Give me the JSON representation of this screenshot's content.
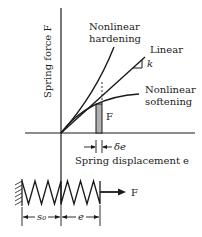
{
  "diagram": {
    "y_axis_label": "Spring force F",
    "x_axis_label": "Spring displacement e",
    "curves": [
      {
        "name": "hardening",
        "label_line1": "Nonlinear",
        "label_line2": "hardening"
      },
      {
        "name": "linear",
        "label": "Linear",
        "slope_label": "k"
      },
      {
        "name": "softening",
        "label_line1": "Nonlinear",
        "label_line2": "softening"
      }
    ],
    "strip_label": "F",
    "increment_label": "δe",
    "spring": {
      "force_label": "F",
      "s0_label": "s₀",
      "e_label": "e"
    },
    "colors": {
      "line": "#1a1a1a",
      "strip_fill": "#b0b0b0"
    }
  }
}
